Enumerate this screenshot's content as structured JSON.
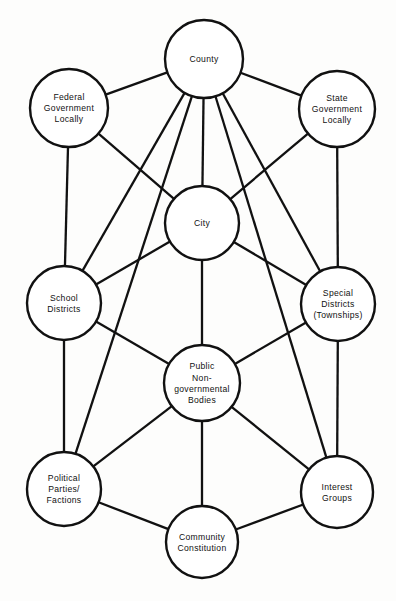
{
  "diagram": {
    "type": "node-link-diagram",
    "background_color": "#fdfdfc",
    "stroke_color": "#111111",
    "node_fill_color": "#ffffff",
    "canvas": {
      "width": 396,
      "height": 601
    }
  },
  "nodes": [
    {
      "id": "county",
      "label": "County",
      "lines": [
        "County"
      ],
      "cx": 204,
      "cy": 59,
      "r": 39
    },
    {
      "id": "federal-government-locally",
      "label": "Federal Government Locally",
      "lines": [
        "Federal",
        "Government",
        "Locally"
      ],
      "cx": 69,
      "cy": 108,
      "r": 39
    },
    {
      "id": "state-government-locally",
      "label": "State Government Locally",
      "lines": [
        "State",
        "Government",
        "Locally"
      ],
      "cx": 337,
      "cy": 109,
      "r": 38
    },
    {
      "id": "city",
      "label": "City",
      "lines": [
        "City"
      ],
      "cx": 202,
      "cy": 223,
      "r": 37
    },
    {
      "id": "school-districts",
      "label": "School Districts",
      "lines": [
        "School",
        "Districts"
      ],
      "cx": 64,
      "cy": 303,
      "r": 37
    },
    {
      "id": "special-districts-townships",
      "label": "Special Districts (Townships)",
      "lines": [
        "Special",
        "Districts",
        "(Townships)"
      ],
      "cx": 338,
      "cy": 304,
      "r": 37
    },
    {
      "id": "public-nongovernmental-bodies",
      "label": "Public Non-governmental Bodies",
      "lines": [
        "Public",
        "Non-",
        "governmental",
        "Bodies"
      ],
      "cx": 202,
      "cy": 383,
      "r": 38
    },
    {
      "id": "political-parties-factions",
      "label": "Political Parties/ Factions",
      "lines": [
        "Political",
        "Parties/",
        "Factions"
      ],
      "cx": 64,
      "cy": 489,
      "r": 37
    },
    {
      "id": "interest-groups",
      "label": "Interest Groups",
      "lines": [
        "Interest",
        "Groups"
      ],
      "cx": 337,
      "cy": 492,
      "r": 36
    },
    {
      "id": "community-constitution",
      "label": "Community Constitution",
      "lines": [
        "Community",
        "Constitution"
      ],
      "cx": 202,
      "cy": 542,
      "r": 36
    }
  ],
  "edges": [
    {
      "from": "county",
      "to": "federal-government-locally"
    },
    {
      "from": "county",
      "to": "state-government-locally"
    },
    {
      "from": "county",
      "to": "city"
    },
    {
      "from": "county",
      "to": "school-districts"
    },
    {
      "from": "county",
      "to": "special-districts-townships"
    },
    {
      "from": "county",
      "to": "political-parties-factions"
    },
    {
      "from": "county",
      "to": "interest-groups"
    },
    {
      "from": "federal-government-locally",
      "to": "school-districts"
    },
    {
      "from": "federal-government-locally",
      "to": "city"
    },
    {
      "from": "state-government-locally",
      "to": "special-districts-townships"
    },
    {
      "from": "state-government-locally",
      "to": "city"
    },
    {
      "from": "city",
      "to": "school-districts"
    },
    {
      "from": "city",
      "to": "special-districts-townships"
    },
    {
      "from": "city",
      "to": "public-nongovernmental-bodies"
    },
    {
      "from": "school-districts",
      "to": "public-nongovernmental-bodies"
    },
    {
      "from": "school-districts",
      "to": "political-parties-factions"
    },
    {
      "from": "special-districts-townships",
      "to": "public-nongovernmental-bodies"
    },
    {
      "from": "special-districts-townships",
      "to": "interest-groups"
    },
    {
      "from": "public-nongovernmental-bodies",
      "to": "political-parties-factions"
    },
    {
      "from": "public-nongovernmental-bodies",
      "to": "interest-groups"
    },
    {
      "from": "public-nongovernmental-bodies",
      "to": "community-constitution"
    },
    {
      "from": "political-parties-factions",
      "to": "community-constitution"
    },
    {
      "from": "interest-groups",
      "to": "community-constitution"
    }
  ]
}
